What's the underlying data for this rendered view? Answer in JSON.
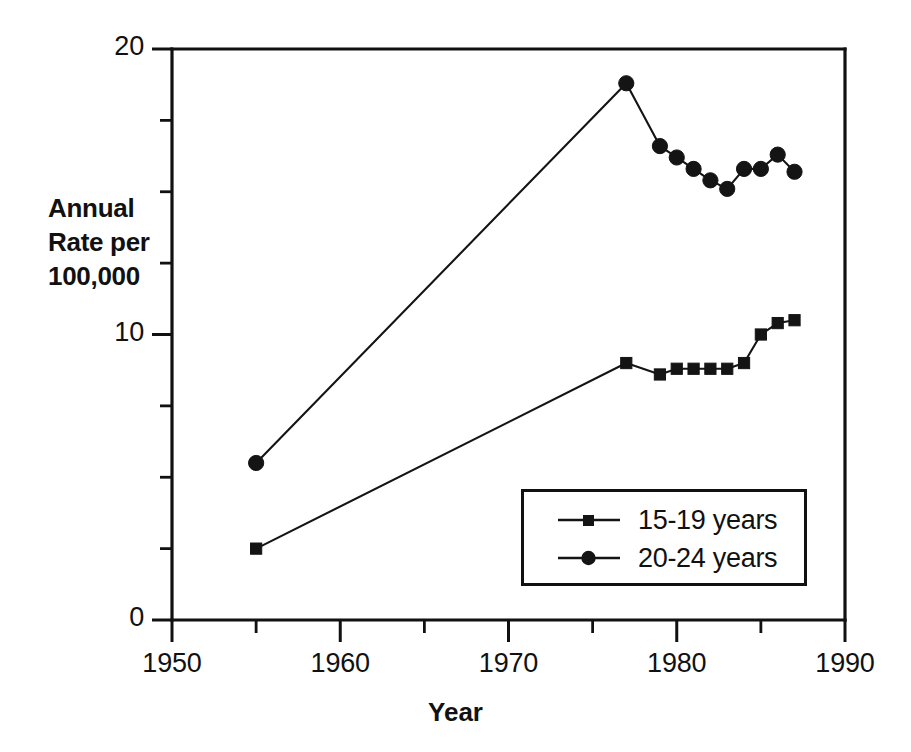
{
  "chart_data": {
    "type": "line",
    "title": "",
    "subtitle": "",
    "xlabel": "Year",
    "ylabel": "Annual Rate per 100,000",
    "ylabel_lines": [
      "Annual",
      "Rate per",
      "100,000"
    ],
    "xlim": [
      1950,
      1990
    ],
    "ylim": [
      0,
      20
    ],
    "grid": false,
    "legend_position": "inside-lower-right",
    "x_ticks_major": [
      1950,
      1960,
      1970,
      1980,
      1990
    ],
    "x_ticks_major_labels": [
      "1950",
      "1960",
      "1970",
      "1980",
      "1990"
    ],
    "x_ticks_minor": [
      1955,
      1965,
      1975,
      1985
    ],
    "y_ticks_major": [
      0,
      10,
      20
    ],
    "y_ticks_major_labels": [
      "0",
      "10",
      "20"
    ],
    "y_ticks_minor": [
      2.5,
      5,
      7.5,
      12.5,
      15,
      17.5
    ],
    "series": [
      {
        "name": "15-19 years",
        "marker": "square",
        "color": "#141414",
        "x": [
          1955,
          1977,
          1979,
          1980,
          1981,
          1982,
          1983,
          1984,
          1985,
          1986,
          1987
        ],
        "values": [
          2.5,
          9.0,
          8.6,
          8.8,
          8.8,
          8.8,
          8.8,
          9.0,
          10.0,
          10.4,
          10.5
        ]
      },
      {
        "name": "20-24 years",
        "marker": "circle",
        "color": "#141414",
        "x": [
          1955,
          1977,
          1979,
          1980,
          1981,
          1982,
          1983,
          1984,
          1985,
          1986,
          1987
        ],
        "values": [
          5.5,
          18.8,
          16.6,
          16.2,
          15.8,
          15.4,
          15.1,
          15.8,
          15.8,
          16.3,
          15.7
        ]
      }
    ]
  },
  "legend": {
    "entries": [
      {
        "label": "15-19 years",
        "marker": "square"
      },
      {
        "label": "20-24 years",
        "marker": "circle"
      }
    ]
  }
}
